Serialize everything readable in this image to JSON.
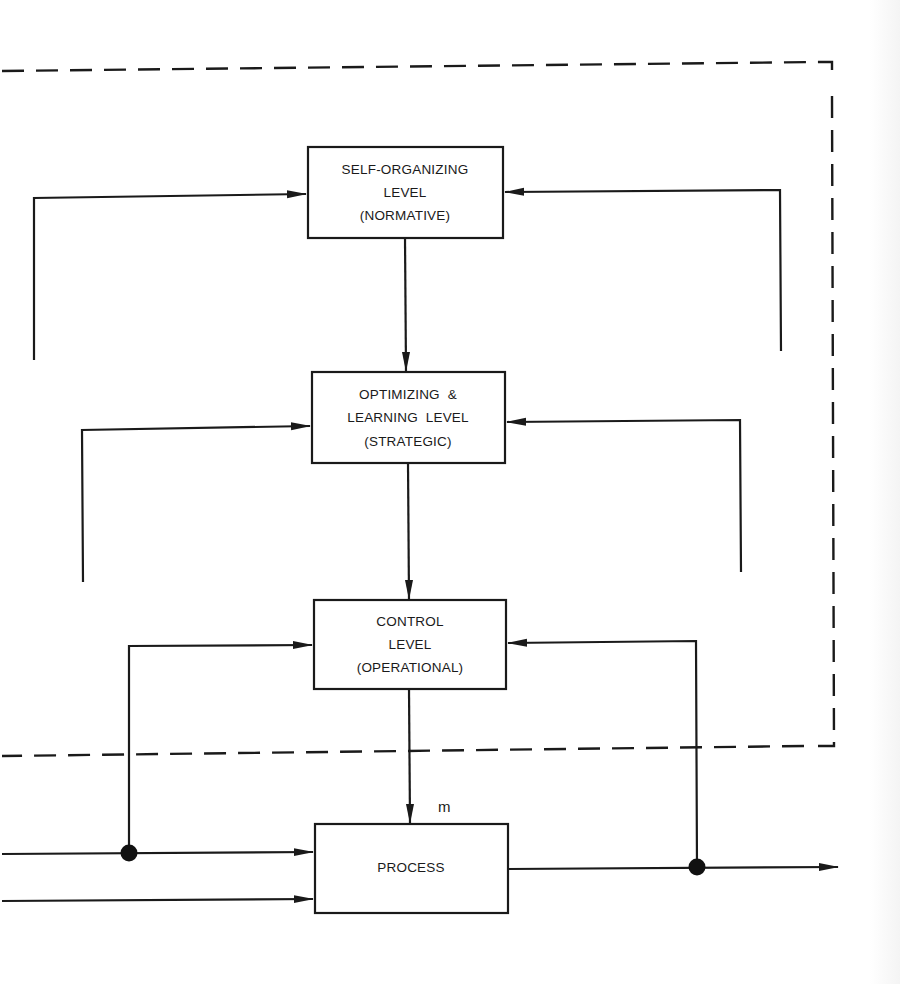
{
  "diagram": {
    "levels": [
      {
        "id": "self-organizing",
        "lines": [
          "SELF-ORGANIZING",
          "LEVEL",
          "(NORMATIVE)"
        ]
      },
      {
        "id": "optimizing-learning",
        "lines": [
          "OPTIMIZING  &",
          "LEARNING  LEVEL",
          "(STRATEGIC)"
        ]
      },
      {
        "id": "control",
        "lines": [
          "CONTROL",
          "LEVEL",
          "(OPERATIONAL)"
        ]
      }
    ],
    "process": {
      "label": "PROCESS",
      "input_label": "m"
    },
    "boundary": {
      "style": "dashed",
      "encloses": [
        "self-organizing",
        "optimizing-learning",
        "control"
      ]
    },
    "connections": [
      {
        "from": "self-organizing",
        "to": "optimizing-learning",
        "type": "arrow-down"
      },
      {
        "from": "optimizing-learning",
        "to": "control",
        "type": "arrow-down"
      },
      {
        "from": "control",
        "to": "process",
        "type": "arrow-down",
        "label": "m"
      },
      {
        "from": "left-feedback",
        "to": "self-organizing",
        "type": "arrow-right"
      },
      {
        "from": "right-feedback",
        "to": "self-organizing",
        "type": "arrow-left"
      },
      {
        "from": "left-feedback",
        "to": "optimizing-learning",
        "type": "arrow-right"
      },
      {
        "from": "right-feedback",
        "to": "optimizing-learning",
        "type": "arrow-left"
      },
      {
        "from": "input-branch",
        "to": "control",
        "type": "arrow-right"
      },
      {
        "from": "output-branch",
        "to": "control",
        "type": "arrow-left"
      },
      {
        "from": "input-1",
        "to": "process",
        "type": "arrow-right",
        "junction": true
      },
      {
        "from": "input-2",
        "to": "process",
        "type": "arrow-right"
      },
      {
        "from": "process",
        "to": "output",
        "type": "arrow-right",
        "junction": true
      }
    ],
    "colors": {
      "ink": "#1a1a1a",
      "background": "#ffffff"
    }
  }
}
